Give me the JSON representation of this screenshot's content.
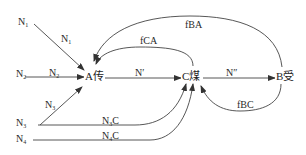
{
  "diagram": {
    "type": "flow-network",
    "nodes": {
      "A": {
        "label": "A传"
      },
      "C": {
        "label": "C煤"
      },
      "B": {
        "label": "B受"
      }
    },
    "sources": {
      "n1": {
        "base": "N",
        "sub": "1"
      },
      "n2": {
        "base": "N",
        "sub": "2"
      },
      "n3": {
        "base": "N",
        "sub": "3"
      },
      "n4": {
        "base": "N",
        "sub": "4"
      }
    },
    "edge_labels": {
      "n1_to_a": {
        "base": "N",
        "sub": "1"
      },
      "n2_to_a": {
        "base": "N",
        "sub": "2"
      },
      "n3_to_a": {
        "base": "N",
        "sub": "3"
      },
      "n3_to_c": {
        "base": "N",
        "sub": "3",
        "suffix": "C"
      },
      "n4_to_c": {
        "base": "N",
        "sub": "4",
        "suffix": "C"
      },
      "a_to_c": "N′",
      "c_to_b": "N″",
      "c_to_a": "fCA",
      "b_to_a": "fBA",
      "b_to_c": "fBC"
    },
    "edges": [
      {
        "from": "N1",
        "to": "A",
        "label": "N1"
      },
      {
        "from": "N2",
        "to": "A",
        "label": "N2"
      },
      {
        "from": "N3",
        "to": "A",
        "label": "N3"
      },
      {
        "from": "N3",
        "to": "C",
        "label": "N3C"
      },
      {
        "from": "N4",
        "to": "C",
        "label": "N4C"
      },
      {
        "from": "A",
        "to": "C",
        "label": "N′"
      },
      {
        "from": "C",
        "to": "B",
        "label": "N″"
      },
      {
        "from": "C",
        "to": "A",
        "label": "fCA"
      },
      {
        "from": "B",
        "to": "A",
        "label": "fBA"
      },
      {
        "from": "B",
        "to": "C",
        "label": "fBC"
      }
    ],
    "colors": {
      "line": "#444444",
      "text": "#2a2a2a",
      "background": "#ffffff"
    }
  }
}
